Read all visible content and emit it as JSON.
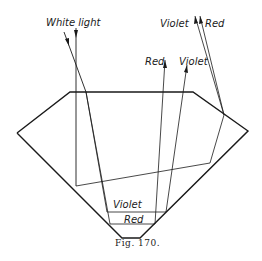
{
  "figure": {
    "caption": "Fig. 170.",
    "labels": {
      "white_light": "White light",
      "exit_violet_top": "Violet",
      "exit_red_top": "Red",
      "exit_red_mid": "Red",
      "exit_violet_mid": "Violet",
      "inner_violet": "Violet",
      "inner_red": "Red"
    }
  }
}
